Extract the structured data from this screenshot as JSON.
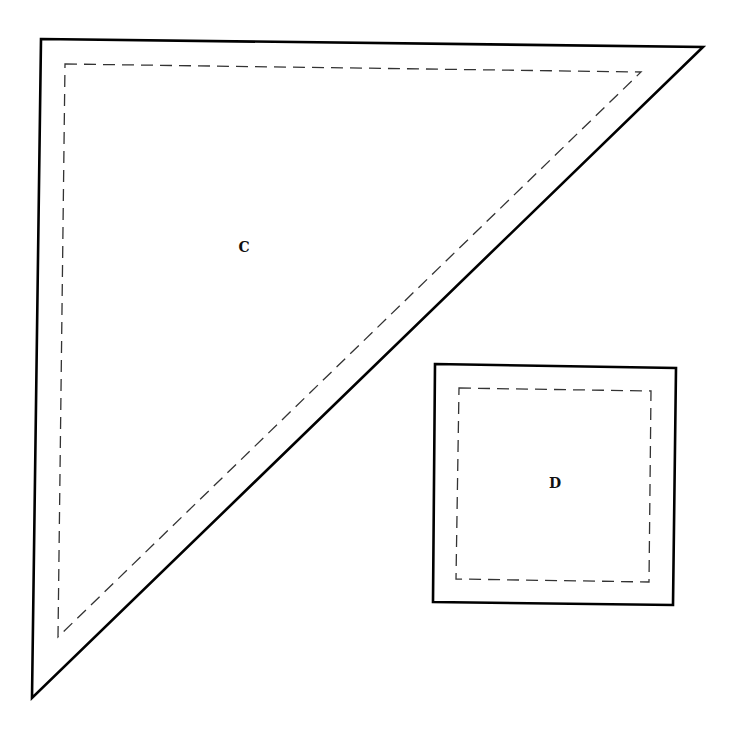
{
  "diagram": {
    "type": "quilt-pattern-pieces",
    "pieces": [
      {
        "label": "C",
        "shape": "triangle",
        "cut_line": [
          [
            41,
            39
          ],
          [
            703,
            47
          ],
          [
            32,
            698
          ]
        ],
        "seam_line": [
          [
            65,
            64
          ],
          [
            641,
            72
          ],
          [
            58,
            637
          ]
        ],
        "label_pos": [
          244,
          252
        ]
      },
      {
        "label": "D",
        "shape": "square",
        "cut_line": [
          [
            435,
            364
          ],
          [
            676,
            368
          ],
          [
            673,
            605
          ],
          [
            433,
            602
          ]
        ],
        "seam_line": [
          [
            459,
            388
          ],
          [
            651,
            391
          ],
          [
            649,
            582
          ],
          [
            456,
            579
          ]
        ],
        "label_pos": [
          555,
          488
        ]
      }
    ],
    "line_colors": {
      "cut": "#000000",
      "seam": "#333333"
    }
  }
}
